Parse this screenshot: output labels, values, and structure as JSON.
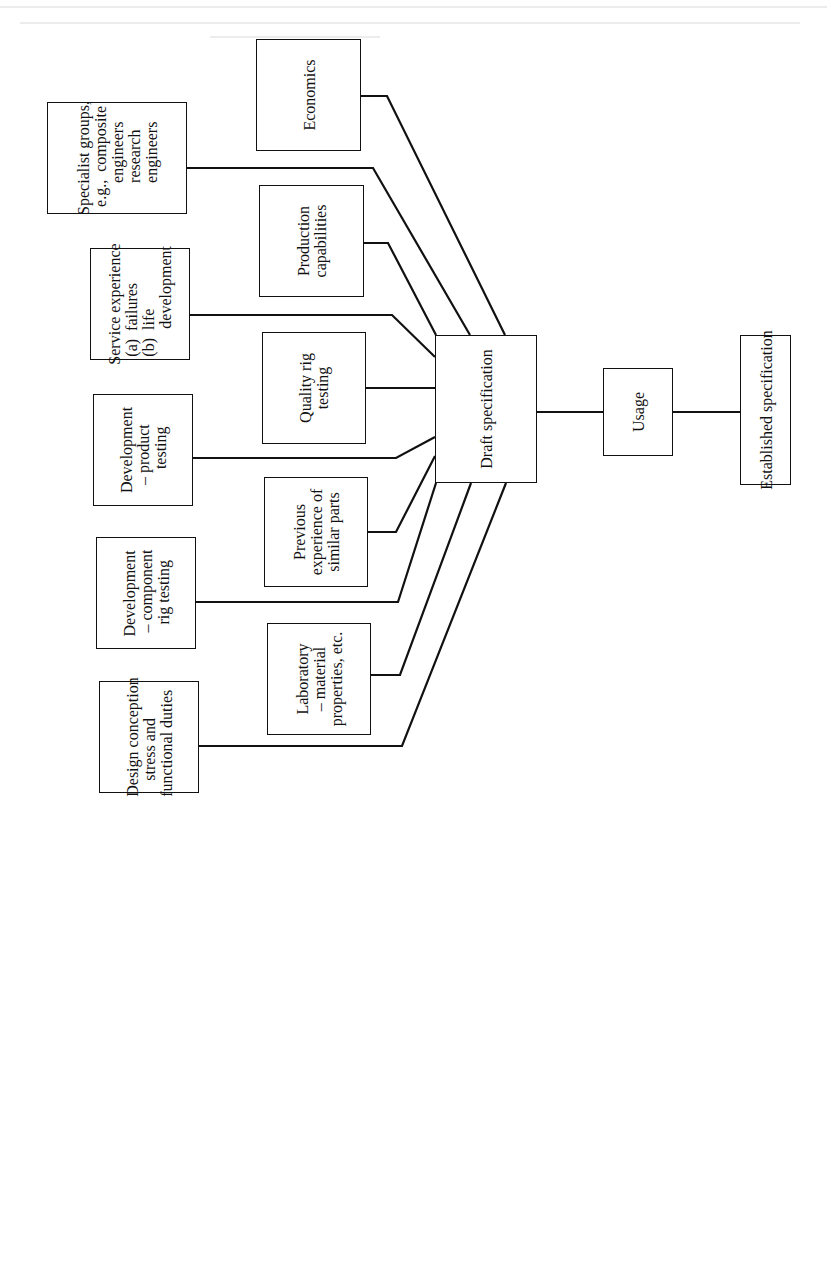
{
  "diagram": {
    "type": "flowchart",
    "orientation": "rotated 90deg counter-clockwise (text reads bottom-to-top)",
    "colors": {
      "line": "#111111",
      "background": "#ffffff"
    },
    "inputs_outer": [
      {
        "id": "specialist",
        "label": "Specialist groups,\n  e.g.,  composite\n        engineers\n        research\n        engineers"
      },
      {
        "id": "service",
        "label": "Service experience\n  (a)  failures\n  (b)  life\n         development"
      },
      {
        "id": "dev_product",
        "label": "Development\n  – product\n      testing"
      },
      {
        "id": "dev_component",
        "label": "Development\n – component\n   rig testing"
      },
      {
        "id": "design",
        "label": "Design conception\n    stress and\nfunctional duties"
      }
    ],
    "inputs_inner": [
      {
        "id": "economics",
        "label": "Economics"
      },
      {
        "id": "production",
        "label": "Production\ncapabilities"
      },
      {
        "id": "quality",
        "label": "Quality rig\ntesting"
      },
      {
        "id": "previous",
        "label": "Previous\nexperience of\nsimilar parts"
      },
      {
        "id": "laboratory",
        "label": "Laboratory\n– material\nproperties, etc."
      }
    ],
    "hub": {
      "id": "draft",
      "label": "Draft specification"
    },
    "chain": [
      {
        "id": "usage",
        "label": "Usage"
      },
      {
        "id": "established",
        "label": "Established specification"
      }
    ]
  }
}
